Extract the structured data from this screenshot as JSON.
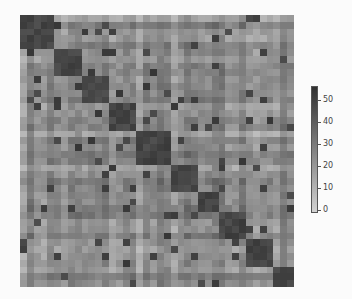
{
  "chart_data": {
    "type": "heatmap",
    "title": "",
    "xlabel": "",
    "ylabel": "",
    "grid": false,
    "n": 40,
    "block_boundaries": [
      0,
      5,
      9,
      13,
      17,
      22,
      26,
      29,
      33,
      37,
      40
    ],
    "value_range": [
      0,
      55
    ],
    "diagonal_block_value": 48,
    "off_block_base": 22,
    "colormap": {
      "low": "#d2d2d2",
      "high": "#303030"
    },
    "colorbar": {
      "ticks": [
        0,
        10,
        20,
        30,
        40,
        50
      ],
      "tick_labels": [
        "0",
        "10",
        "20",
        "30",
        "40",
        "50"
      ],
      "position": "right"
    }
  }
}
